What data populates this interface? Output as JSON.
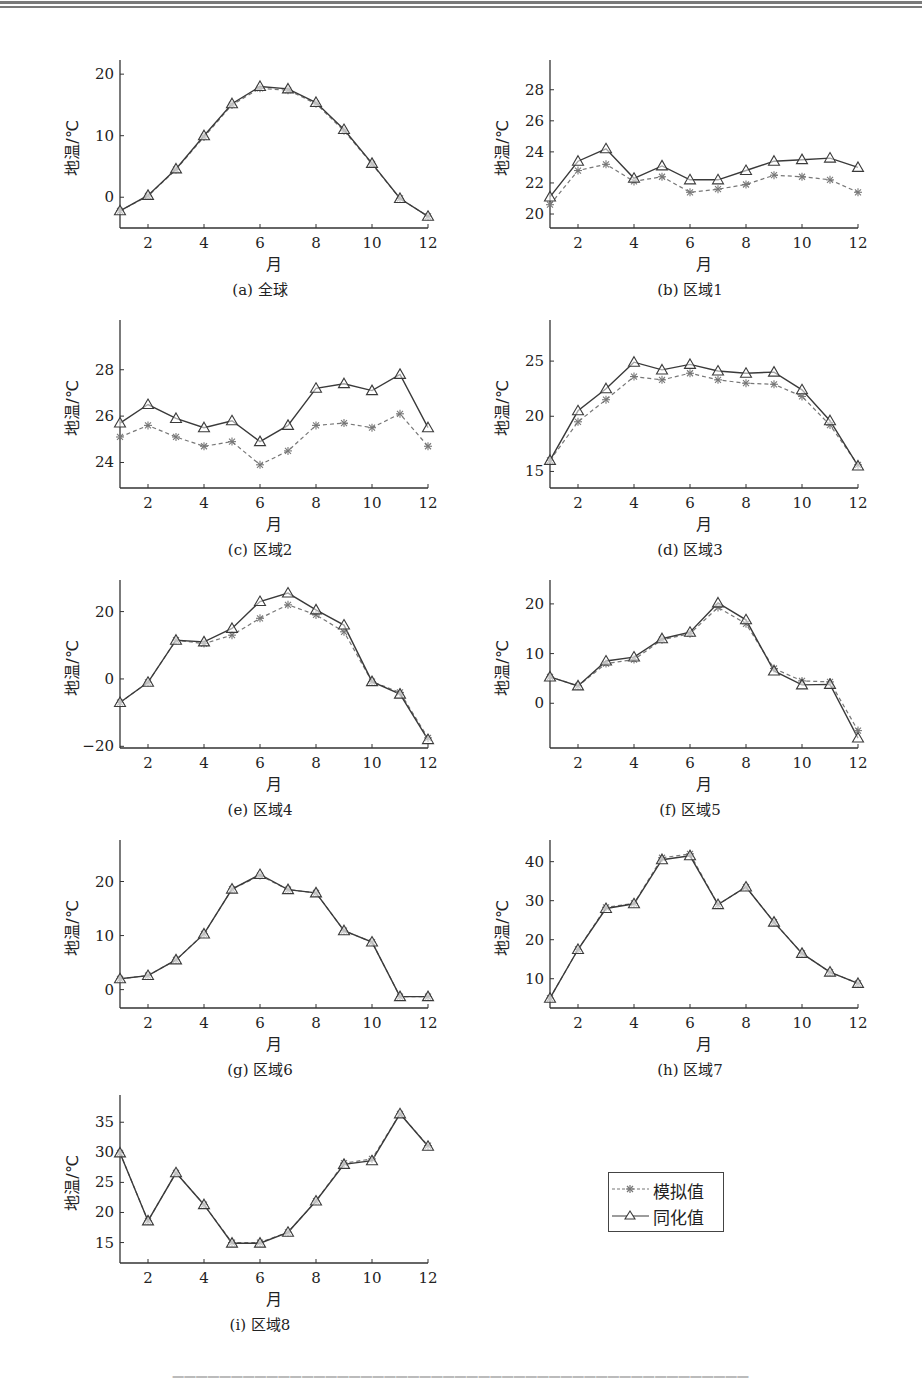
{
  "legend": {
    "simulated_label": "模拟值",
    "assimilated_label": "同化值"
  },
  "colors": {
    "simulated": "#777777",
    "assimilated": "#3a3a3a",
    "axis": "#333333"
  },
  "chart_data": [
    {
      "id": "a",
      "type": "line",
      "caption": "(a) 全球",
      "xlabel": "月",
      "ylabel": "地温/℃",
      "x": [
        1,
        2,
        3,
        4,
        5,
        6,
        7,
        8,
        9,
        10,
        11,
        12
      ],
      "xticks": [
        2,
        4,
        6,
        8,
        10,
        12
      ],
      "ylim": [
        -5,
        21
      ],
      "yticks": [
        0,
        10,
        20
      ],
      "series": [
        {
          "name": "模拟值",
          "values": [
            -2.2,
            0.2,
            4.5,
            9.8,
            15.0,
            17.7,
            17.4,
            15.2,
            10.8,
            5.4,
            -0.2,
            -3.1
          ]
        },
        {
          "name": "同化值",
          "values": [
            -2.2,
            0.3,
            4.6,
            10.0,
            15.2,
            18.0,
            17.6,
            15.4,
            11.0,
            5.5,
            -0.2,
            -3.1
          ]
        }
      ]
    },
    {
      "id": "b",
      "type": "line",
      "caption": "(b) 区域1",
      "xlabel": "月",
      "ylabel": "地温/℃",
      "x": [
        1,
        2,
        3,
        4,
        5,
        6,
        7,
        8,
        9,
        10,
        11,
        12
      ],
      "xticks": [
        2,
        4,
        6,
        8,
        10,
        12
      ],
      "ylim": [
        19.1,
        29.4
      ],
      "yticks": [
        20,
        22,
        24,
        26,
        28
      ],
      "series": [
        {
          "name": "模拟值",
          "values": [
            20.6,
            22.8,
            23.2,
            22.1,
            22.4,
            21.4,
            21.6,
            21.9,
            22.5,
            22.4,
            22.2,
            21.4
          ]
        },
        {
          "name": "同化值",
          "values": [
            21.1,
            23.4,
            24.2,
            22.3,
            23.1,
            22.2,
            22.2,
            22.8,
            23.4,
            23.5,
            23.6,
            23.0
          ]
        }
      ]
    },
    {
      "id": "c",
      "type": "line",
      "caption": "(c) 区域2",
      "xlabel": "月",
      "ylabel": "地温/℃",
      "x": [
        1,
        2,
        3,
        4,
        5,
        6,
        7,
        8,
        9,
        10,
        11,
        12
      ],
      "xticks": [
        2,
        4,
        6,
        8,
        10,
        12
      ],
      "ylim": [
        22.9,
        29.8
      ],
      "yticks": [
        24,
        26,
        28
      ],
      "series": [
        {
          "name": "模拟值",
          "values": [
            25.1,
            25.6,
            25.1,
            24.7,
            24.9,
            23.9,
            24.5,
            25.6,
            25.7,
            25.5,
            26.1,
            24.7
          ]
        },
        {
          "name": "同化值",
          "values": [
            25.7,
            26.5,
            25.9,
            25.5,
            25.8,
            24.9,
            25.6,
            27.2,
            27.4,
            27.1,
            27.8,
            25.5
          ]
        }
      ]
    },
    {
      "id": "d",
      "type": "line",
      "caption": "(d) 区域3",
      "xlabel": "月",
      "ylabel": "地温/℃",
      "x": [
        1,
        2,
        3,
        4,
        5,
        6,
        7,
        8,
        9,
        10,
        11,
        12
      ],
      "xticks": [
        2,
        4,
        6,
        8,
        10,
        12
      ],
      "ylim": [
        13.5,
        28.0
      ],
      "yticks": [
        15,
        20,
        25
      ],
      "series": [
        {
          "name": "模拟值",
          "values": [
            16.0,
            19.5,
            21.5,
            23.6,
            23.3,
            23.9,
            23.3,
            23.0,
            22.9,
            21.8,
            19.2,
            15.6
          ]
        },
        {
          "name": "同化值",
          "values": [
            16.0,
            20.5,
            22.5,
            24.9,
            24.2,
            24.7,
            24.1,
            23.9,
            24.0,
            22.4,
            19.6,
            15.5
          ]
        }
      ]
    },
    {
      "id": "e",
      "type": "line",
      "caption": "(e) 区域4",
      "xlabel": "月",
      "ylabel": "地温/℃",
      "x": [
        1,
        2,
        3,
        4,
        5,
        6,
        7,
        8,
        9,
        10,
        11,
        12
      ],
      "xticks": [
        2,
        4,
        6,
        8,
        10,
        12
      ],
      "ylim": [
        -20.5,
        27.0
      ],
      "yticks": [
        -20,
        0,
        20
      ],
      "series": [
        {
          "name": "模拟值",
          "values": [
            -7.0,
            -1.0,
            11.5,
            10.5,
            13.0,
            18.0,
            22.0,
            19.0,
            14.0,
            -0.8,
            -4.0,
            -17.5
          ]
        },
        {
          "name": "同化值",
          "values": [
            -7.0,
            -1.0,
            11.5,
            11.0,
            15.0,
            23.0,
            25.5,
            20.5,
            16.0,
            -0.8,
            -4.5,
            -18.0
          ]
        }
      ]
    },
    {
      "id": "f",
      "type": "line",
      "caption": "(f) 区域5",
      "xlabel": "月",
      "ylabel": "地温/℃",
      "x": [
        1,
        2,
        3,
        4,
        5,
        6,
        7,
        8,
        9,
        10,
        11,
        12
      ],
      "xticks": [
        2,
        4,
        6,
        8,
        10,
        12
      ],
      "ylim": [
        -9.0,
        23.2
      ],
      "yticks": [
        0,
        10,
        20
      ],
      "series": [
        {
          "name": "模拟值",
          "values": [
            5.3,
            3.5,
            8.0,
            8.8,
            12.8,
            14.0,
            19.3,
            16.0,
            7.0,
            4.5,
            4.3,
            -5.5
          ]
        },
        {
          "name": "同化值",
          "values": [
            5.3,
            3.5,
            8.5,
            9.3,
            13.0,
            14.3,
            20.2,
            16.8,
            6.5,
            3.7,
            3.8,
            -7.0
          ]
        }
      ]
    },
    {
      "id": "g",
      "type": "line",
      "caption": "(g) 区域6",
      "xlabel": "月",
      "ylabel": "地温/℃",
      "x": [
        1,
        2,
        3,
        4,
        5,
        6,
        7,
        8,
        9,
        10,
        11,
        12
      ],
      "xticks": [
        2,
        4,
        6,
        8,
        10,
        12
      ],
      "ylim": [
        -3.4,
        26.2
      ],
      "yticks": [
        0,
        10,
        20
      ],
      "series": [
        {
          "name": "模拟值",
          "values": [
            2.0,
            2.6,
            5.5,
            10.3,
            18.6,
            21.1,
            18.5,
            17.9,
            10.9,
            8.8,
            -1.3,
            -1.3
          ]
        },
        {
          "name": "同化值",
          "values": [
            2.0,
            2.6,
            5.5,
            10.3,
            18.6,
            21.3,
            18.5,
            17.9,
            10.9,
            8.8,
            -1.3,
            -1.3
          ]
        }
      ]
    },
    {
      "id": "h",
      "type": "line",
      "caption": "(h) 区域7",
      "xlabel": "月",
      "ylabel": "地温/℃",
      "x": [
        1,
        2,
        3,
        4,
        5,
        6,
        7,
        8,
        9,
        10,
        11,
        12
      ],
      "xticks": [
        2,
        4,
        6,
        8,
        10,
        12
      ],
      "ylim": [
        2.5,
        43.5
      ],
      "yticks": [
        10,
        20,
        30,
        40
      ],
      "series": [
        {
          "name": "模拟值",
          "values": [
            5.0,
            17.5,
            28.3,
            29.3,
            41.0,
            42.0,
            29.0,
            33.5,
            24.5,
            16.5,
            11.7,
            8.8
          ]
        },
        {
          "name": "同化值",
          "values": [
            5.0,
            17.5,
            28.0,
            29.2,
            40.5,
            41.5,
            29.0,
            33.5,
            24.5,
            16.5,
            11.7,
            8.8
          ]
        }
      ]
    },
    {
      "id": "i",
      "type": "line",
      "caption": "(i) 区域8",
      "xlabel": "月",
      "ylabel": "地温/℃",
      "x": [
        1,
        2,
        3,
        4,
        5,
        6,
        7,
        8,
        9,
        10,
        11,
        12
      ],
      "xticks": [
        2,
        4,
        6,
        8,
        10,
        12
      ],
      "ylim": [
        11.6,
        38.2
      ],
      "yticks": [
        15,
        20,
        25,
        30,
        35
      ],
      "series": [
        {
          "name": "模拟值",
          "values": [
            29.9,
            18.6,
            26.6,
            21.3,
            15.0,
            15.0,
            16.7,
            21.9,
            28.2,
            28.9,
            36.4,
            31.1
          ]
        },
        {
          "name": "同化值",
          "values": [
            29.9,
            18.6,
            26.6,
            21.3,
            14.9,
            14.9,
            16.7,
            21.9,
            28.0,
            28.6,
            36.4,
            31.0
          ]
        }
      ]
    }
  ]
}
